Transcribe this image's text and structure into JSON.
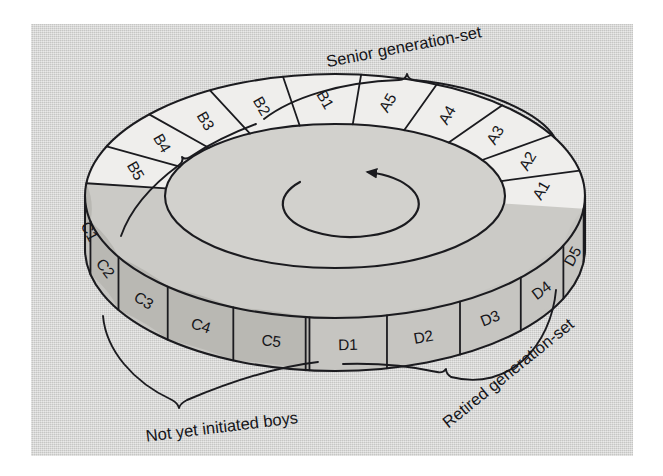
{
  "figure": {
    "kind": "cyclical-age-set-ring-diagram",
    "title": "",
    "rotation_arrow": {
      "name": "counterclockwise-rotation-arrow",
      "direction": "counterclockwise"
    },
    "background_color": "#d4d4d2",
    "ink_color": "#1b1b1f"
  },
  "palette": {
    "page": "#d4d4d2",
    "segment_light": "#efeeec",
    "segment_mid": "#c6c5c1",
    "segment_dark": "#b9b8b3",
    "ring_top_face": "#cbcac6",
    "ring_inner": "#d2d1cd",
    "ink": "#1b1b1f"
  },
  "segments": [
    {
      "id": "A1",
      "label": "A1",
      "group": "A",
      "tone": "light"
    },
    {
      "id": "A2",
      "label": "A2",
      "group": "A",
      "tone": "light"
    },
    {
      "id": "A3",
      "label": "A3",
      "group": "A",
      "tone": "light"
    },
    {
      "id": "A4",
      "label": "A4",
      "group": "A",
      "tone": "light"
    },
    {
      "id": "A5",
      "label": "A5",
      "group": "A",
      "tone": "light"
    },
    {
      "id": "B1",
      "label": "B1",
      "group": "B",
      "tone": "light"
    },
    {
      "id": "B2",
      "label": "B2",
      "group": "B",
      "tone": "light"
    },
    {
      "id": "B3",
      "label": "B3",
      "group": "B",
      "tone": "light"
    },
    {
      "id": "B4",
      "label": "B4",
      "group": "B",
      "tone": "light"
    },
    {
      "id": "B5",
      "label": "B5",
      "group": "B",
      "tone": "light"
    },
    {
      "id": "C1",
      "label": "C1",
      "group": "C",
      "tone": "dark"
    },
    {
      "id": "C2",
      "label": "C2",
      "group": "C",
      "tone": "dark"
    },
    {
      "id": "C3",
      "label": "C3",
      "group": "C",
      "tone": "dark"
    },
    {
      "id": "C4",
      "label": "C4",
      "group": "C",
      "tone": "dark"
    },
    {
      "id": "C5",
      "label": "C5",
      "group": "C",
      "tone": "dark"
    },
    {
      "id": "D1",
      "label": "D1",
      "group": "D",
      "tone": "mid"
    },
    {
      "id": "D2",
      "label": "D2",
      "group": "D",
      "tone": "mid"
    },
    {
      "id": "D3",
      "label": "D3",
      "group": "D",
      "tone": "mid"
    },
    {
      "id": "D4",
      "label": "D4",
      "group": "D",
      "tone": "mid"
    },
    {
      "id": "D5",
      "label": "D5",
      "group": "D",
      "tone": "mid"
    }
  ],
  "annotations": {
    "senior": {
      "text": "Senior generation-set",
      "covers": [
        "A1",
        "A2",
        "A3",
        "A4",
        "A5"
      ],
      "position": "top-right"
    },
    "not_yet_initiated": {
      "text": "Not yet initiated boys",
      "covers": [
        "C1",
        "C2",
        "C3",
        "C4",
        "C5"
      ],
      "position": "bottom-left"
    },
    "retired": {
      "text": "Retired generation-set",
      "covers": [
        "D1",
        "D2",
        "D3",
        "D4",
        "D5"
      ],
      "position": "bottom-right"
    },
    "unlabeled_group_brace": {
      "text": "",
      "covers": [
        "B1",
        "B2",
        "B3",
        "B4",
        "B5"
      ],
      "position": "top-left"
    }
  }
}
